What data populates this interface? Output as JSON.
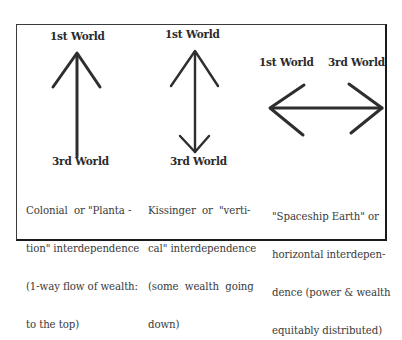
{
  "diagram": {
    "panels": [
      {
        "id": "colonial",
        "top_label": "1st World",
        "bottom_label": "3rd World",
        "arrow": "up",
        "caption_lines": [
          "Colonial  or \"Planta -",
          "tion\" interdependence",
          "(1-way flow of wealth:",
          "to the top)"
        ]
      },
      {
        "id": "kissinger",
        "top_label": "1st World",
        "bottom_label": "3rd World",
        "arrow": "up-and-down",
        "caption_lines": [
          "Kissinger  or  \"verti-",
          "cal\" interdependence",
          "(some  wealth  going",
          "down)"
        ]
      },
      {
        "id": "spaceship",
        "left_label": "1st World",
        "right_label": "3rd World",
        "arrow": "left-and-right",
        "caption_lines": [
          "\"Spaceship Earth\" or",
          "horizontal interdepen-",
          "dence (power & wealth",
          "equitably distributed)"
        ]
      }
    ],
    "colors": {
      "line": "#2e2e2e",
      "text": "#2a2a2a",
      "background": "#ffffff"
    }
  }
}
